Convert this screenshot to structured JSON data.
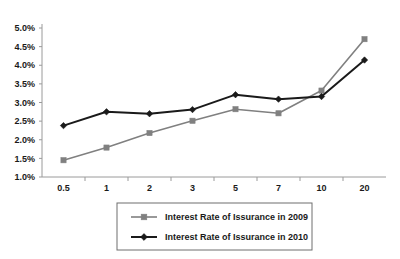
{
  "chart_data": {
    "type": "line",
    "title": "",
    "xlabel": "",
    "ylabel": "",
    "categories": [
      "0.5",
      "1",
      "2",
      "3",
      "5",
      "7",
      "10",
      "20"
    ],
    "ylim": [
      1.0,
      5.0
    ],
    "ytick_values": [
      1.0,
      1.5,
      2.0,
      2.5,
      3.0,
      3.5,
      4.0,
      4.5,
      5.0
    ],
    "ytick_labels": [
      "1.0%",
      "1.5%",
      "2.0%",
      "2.5%",
      "3.0%",
      "3.5%",
      "4.0%",
      "4.5%",
      "5.0%"
    ],
    "grid": false,
    "legend_position": "bottom",
    "series": [
      {
        "name": "Interest Rate of Issurance in 2009",
        "color": "#808080",
        "marker": "square",
        "values": [
          1.45,
          1.79,
          2.18,
          2.51,
          2.82,
          2.71,
          3.32,
          4.7
        ]
      },
      {
        "name": "Interest Rate of Issurance in 2010",
        "color": "#1a1a1a",
        "marker": "diamond",
        "values": [
          2.38,
          2.75,
          2.7,
          2.81,
          3.21,
          3.09,
          3.16,
          4.14
        ]
      }
    ]
  },
  "axis": {
    "line_color": "#9a9a9a"
  },
  "legend": {
    "border_color": "#6e6e6e",
    "items": [
      {
        "label": "Interest Rate of Issurance in 2009"
      },
      {
        "label": "Interest Rate of Issurance in 2010"
      }
    ]
  }
}
